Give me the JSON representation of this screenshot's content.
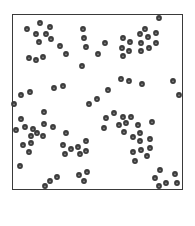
{
  "figure": {
    "type": "point-distribution",
    "frame": {
      "x": 12,
      "y": 14,
      "width": 171,
      "height": 176,
      "stroke": "#3a3a3a"
    },
    "dot": {
      "radius": 2.9,
      "fill": "#3c3c3c",
      "highlight": "#8a8a8a"
    },
    "dots": [
      [
        40,
        23
      ],
      [
        27,
        29
      ],
      [
        50,
        27
      ],
      [
        36,
        34
      ],
      [
        46,
        34
      ],
      [
        51,
        39
      ],
      [
        39,
        42
      ],
      [
        60,
        46
      ],
      [
        66,
        54
      ],
      [
        29,
        58
      ],
      [
        36,
        60
      ],
      [
        43,
        57
      ],
      [
        83,
        29
      ],
      [
        84,
        38
      ],
      [
        86,
        47
      ],
      [
        82,
        66
      ],
      [
        98,
        54
      ],
      [
        105,
        43
      ],
      [
        159,
        18
      ],
      [
        145,
        29
      ],
      [
        140,
        34
      ],
      [
        148,
        37
      ],
      [
        156,
        33
      ],
      [
        123,
        38
      ],
      [
        130,
        42
      ],
      [
        141,
        43
      ],
      [
        149,
        48
      ],
      [
        156,
        43
      ],
      [
        122,
        48
      ],
      [
        129,
        51
      ],
      [
        141,
        51
      ],
      [
        123,
        56
      ],
      [
        121,
        79
      ],
      [
        129,
        81
      ],
      [
        142,
        84
      ],
      [
        173,
        81
      ],
      [
        179,
        95
      ],
      [
        108,
        90
      ],
      [
        97,
        99
      ],
      [
        89,
        104
      ],
      [
        14,
        104
      ],
      [
        21,
        95
      ],
      [
        30,
        92
      ],
      [
        54,
        88
      ],
      [
        63,
        86
      ],
      [
        44,
        112
      ],
      [
        21,
        119
      ],
      [
        16,
        130
      ],
      [
        25,
        127
      ],
      [
        33,
        129
      ],
      [
        44,
        124
      ],
      [
        37,
        133
      ],
      [
        31,
        136
      ],
      [
        43,
        136
      ],
      [
        53,
        127
      ],
      [
        23,
        145
      ],
      [
        31,
        143
      ],
      [
        29,
        152
      ],
      [
        20,
        166
      ],
      [
        66,
        133
      ],
      [
        63,
        145
      ],
      [
        65,
        154
      ],
      [
        71,
        149
      ],
      [
        78,
        147
      ],
      [
        80,
        154
      ],
      [
        86,
        141
      ],
      [
        86,
        151
      ],
      [
        114,
        113
      ],
      [
        106,
        118
      ],
      [
        123,
        117
      ],
      [
        131,
        117
      ],
      [
        126,
        123
      ],
      [
        119,
        125
      ],
      [
        104,
        128
      ],
      [
        124,
        132
      ],
      [
        138,
        125
      ],
      [
        152,
        122
      ],
      [
        140,
        133
      ],
      [
        133,
        137
      ],
      [
        140,
        141
      ],
      [
        150,
        139
      ],
      [
        150,
        148
      ],
      [
        133,
        152
      ],
      [
        141,
        150
      ],
      [
        147,
        156
      ],
      [
        135,
        161
      ],
      [
        79,
        175
      ],
      [
        87,
        172
      ],
      [
        84,
        181
      ],
      [
        57,
        177
      ],
      [
        50,
        181
      ],
      [
        45,
        186
      ],
      [
        160,
        170
      ],
      [
        155,
        178
      ],
      [
        166,
        183
      ],
      [
        175,
        174
      ],
      [
        177,
        183
      ],
      [
        159,
        186
      ]
    ]
  }
}
